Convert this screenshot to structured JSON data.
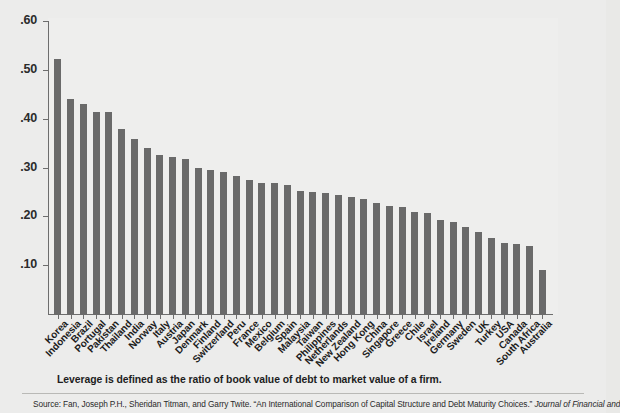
{
  "figure": {
    "caption": "Leverage is defined as the ratio of book value of debt to market value of a firm.",
    "source_prefix": "Source: Fan, Joseph P.H., Sheridan Titman, and Garry Twite. “An International Comparison of Capital Structure and Debt Maturity Choices.” ",
    "source_italic": "Journal of Financial and"
  },
  "colors": {
    "bar": "#6a6a6a",
    "axis": "#6d6d6d",
    "background": "#ececeb",
    "text": "#1d1d1d"
  },
  "chart_data": {
    "type": "bar",
    "title": "",
    "xlabel": "",
    "ylabel": "",
    "ylim": [
      0,
      0.6
    ],
    "grid": false,
    "legend": "none",
    "ytick_labels": [
      ".60",
      ".50",
      ".40",
      ".30",
      ".20",
      ".10"
    ],
    "ytick_values": [
      0.6,
      0.5,
      0.4,
      0.3,
      0.2,
      0.1
    ],
    "categories": [
      "Korea",
      "Indonesia",
      "Brazil",
      "Portugal",
      "Pakistan",
      "Thailand",
      "India",
      "Norway",
      "Italy",
      "Austria",
      "Japan",
      "Denmark",
      "Finland",
      "Switzerland",
      "Peru",
      "France",
      "Mexico",
      "Belgium",
      "Spain",
      "Malaysia",
      "Taiwan",
      "Philippines",
      "Netherlands",
      "New Zealand",
      "Hong Kong",
      "China",
      "Singapore",
      "Greece",
      "Chile",
      "Israel",
      "Ireland",
      "Germany",
      "Sweden",
      "UK",
      "Turkey",
      "USA",
      "Canada",
      "South Africa",
      "Australia"
    ],
    "values": [
      0.525,
      0.443,
      0.432,
      0.415,
      0.415,
      0.38,
      0.36,
      0.342,
      0.327,
      0.324,
      0.32,
      0.301,
      0.296,
      0.292,
      0.284,
      0.277,
      0.271,
      0.271,
      0.267,
      0.253,
      0.251,
      0.249,
      0.245,
      0.241,
      0.237,
      0.229,
      0.224,
      0.221,
      0.21,
      0.208,
      0.195,
      0.19,
      0.181,
      0.169,
      0.158,
      0.148,
      0.146,
      0.142,
      0.092
    ]
  }
}
